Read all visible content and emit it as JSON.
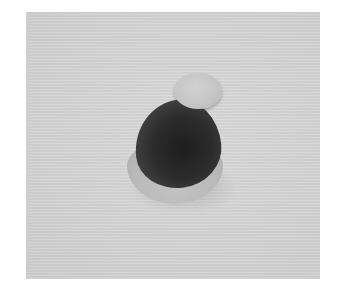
{
  "image": {
    "description": "Grayscale photograph of a small hat-shaped object with a light pom-pom, dark body and light brim on a light gray textured background",
    "colors": {
      "border": "#ffffff",
      "background": "#d6d6d6",
      "hat_body": "#2a2a2a",
      "pom_pom": "#c6c6c6",
      "brim": "#b9b9b9"
    }
  }
}
